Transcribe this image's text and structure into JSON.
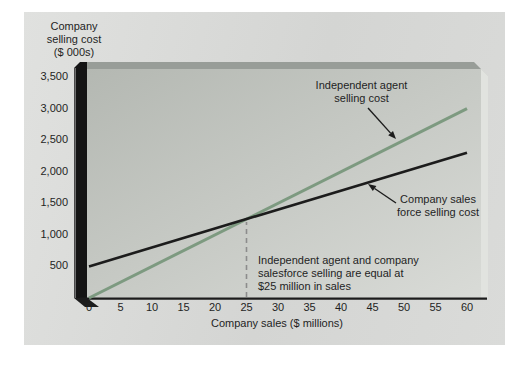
{
  "figure": {
    "y_axis_title": "Company\nselling cost\n($ 000s)",
    "x_axis_title": "Company sales ($ millions)"
  },
  "annotations": {
    "agent_label": "Independent agent\nselling cost",
    "salesforce_label": "Company sales\nforce selling cost",
    "equal_note": "Independent agent and company\nsalesforce selling are equal at\n$25 million in sales"
  },
  "colors": {
    "agent_line": "#7d9a80",
    "salesforce_line": "#1c1c1c",
    "dashed_guide": "#8c8c8c",
    "text": "#1f1f1f"
  },
  "chart_data": {
    "type": "line",
    "title": "",
    "xlabel": "Company sales ($ millions)",
    "ylabel": "Company selling cost ($ 000s)",
    "xlim": [
      0,
      60
    ],
    "ylim": [
      0,
      3500
    ],
    "grid": false,
    "legend_position": "inline-annotations",
    "x_ticks": [
      0,
      5,
      10,
      15,
      20,
      25,
      30,
      35,
      40,
      45,
      50,
      55,
      60
    ],
    "y_tick_values": [
      500,
      1000,
      1500,
      2000,
      2500,
      3000,
      3500
    ],
    "y_tick_labels": [
      "500",
      "1,000",
      "1,500",
      "2,000",
      "2,500",
      "3,000",
      "3,500"
    ],
    "series": [
      {
        "name": "Independent agent selling cost",
        "color": "#7d9a80",
        "points": [
          [
            0,
            0
          ],
          [
            60,
            3000
          ]
        ]
      },
      {
        "name": "Company sales force selling cost",
        "color": "#1c1c1c",
        "points": [
          [
            0,
            500
          ],
          [
            60,
            2300
          ]
        ]
      }
    ],
    "intersection": {
      "x": 25,
      "y": 1250,
      "note": "Independent agent and company salesforce selling are equal at $25 million in sales"
    }
  }
}
